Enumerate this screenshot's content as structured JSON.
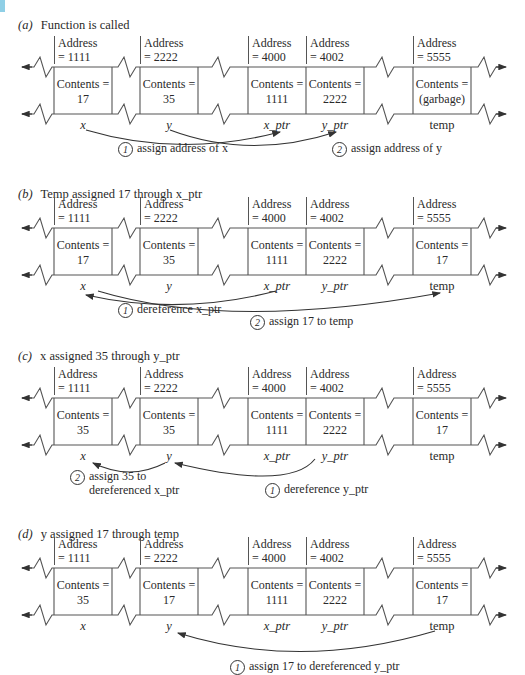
{
  "panels": [
    {
      "id": "a",
      "letter": "(a)",
      "title": "Function is called",
      "cells": [
        {
          "name": "x",
          "address": "Address\n= 1111",
          "contents": "Contents =",
          "value": "17"
        },
        {
          "name": "y",
          "address": "Address\n= 2222",
          "contents": "Contents =",
          "value": "35"
        },
        {
          "name": "x_ptr",
          "address": "Address\n= 4000",
          "contents": "Contents =",
          "value": "1111"
        },
        {
          "name": "y_ptr",
          "address": "Address\n= 4002",
          "contents": "Contents =",
          "value": "2222"
        },
        {
          "name": "temp",
          "address": "Address\n= 5555",
          "contents": "Contents =",
          "value": "(garbage)"
        }
      ],
      "notes": [
        {
          "num": "1",
          "text": "assign address of x"
        },
        {
          "num": "2",
          "text": "assign address of y"
        }
      ]
    },
    {
      "id": "b",
      "letter": "(b)",
      "title": "Temp assigned 17 through x_ptr",
      "cells": [
        {
          "name": "x",
          "address": "Address\n= 1111",
          "contents": "Contents =",
          "value": "17"
        },
        {
          "name": "y",
          "address": "Address\n= 2222",
          "contents": "Contents =",
          "value": "35"
        },
        {
          "name": "x_ptr",
          "address": "Address\n= 4000",
          "contents": "Contents =",
          "value": "1111"
        },
        {
          "name": "y_ptr",
          "address": "Address\n= 4002",
          "contents": "Contents =",
          "value": "2222"
        },
        {
          "name": "temp",
          "address": "Address\n= 5555",
          "contents": "Contents =",
          "value": "17"
        }
      ],
      "notes": [
        {
          "num": "1",
          "text": "dereference x_ptr"
        },
        {
          "num": "2",
          "text": "assign 17 to temp"
        }
      ]
    },
    {
      "id": "c",
      "letter": "(c)",
      "title": "x assigned 35 through y_ptr",
      "cells": [
        {
          "name": "x",
          "address": "Address\n= 1111",
          "contents": "Contents =",
          "value": "35"
        },
        {
          "name": "y",
          "address": "Address\n= 2222",
          "contents": "Contents =",
          "value": "35"
        },
        {
          "name": "x_ptr",
          "address": "Address\n= 4000",
          "contents": "Contents =",
          "value": "1111"
        },
        {
          "name": "y_ptr",
          "address": "Address\n= 4002",
          "contents": "Contents =",
          "value": "2222"
        },
        {
          "name": "temp",
          "address": "Address\n= 5555",
          "contents": "Contents =",
          "value": "17"
        }
      ],
      "notes": [
        {
          "num": "2",
          "text": "assign 35 to\ndereferenced x_ptr"
        },
        {
          "num": "1",
          "text": "dereference y_ptr"
        }
      ]
    },
    {
      "id": "d",
      "letter": "(d)",
      "title": "y assigned 17 through temp",
      "cells": [
        {
          "name": "x",
          "address": "Address\n= 1111",
          "contents": "Contents =",
          "value": "35"
        },
        {
          "name": "y",
          "address": "Address\n= 2222",
          "contents": "Contents =",
          "value": "17"
        },
        {
          "name": "x_ptr",
          "address": "Address\n= 4000",
          "contents": "Contents =",
          "value": "1111"
        },
        {
          "name": "y_ptr",
          "address": "Address\n= 4002",
          "contents": "Contents =",
          "value": "2222"
        },
        {
          "name": "temp",
          "address": "Address\n= 5555",
          "contents": "Contents =",
          "value": "17"
        }
      ],
      "notes": [
        {
          "num": "1",
          "text": "assign 17 to dereferenced y_ptr"
        }
      ]
    }
  ],
  "colors": {
    "ink": "#2a2a2a",
    "line": "#555555",
    "accent": "#8fcfe6"
  }
}
